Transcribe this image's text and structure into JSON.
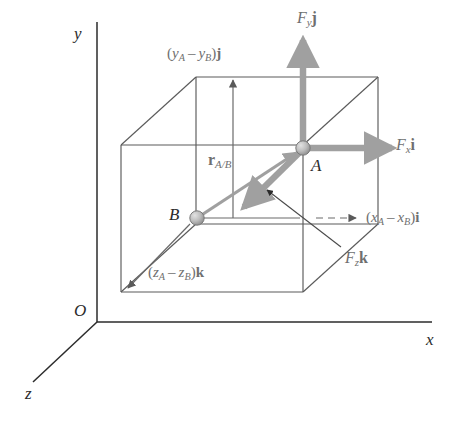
{
  "figure": {
    "background": "#ffffff",
    "width": 462,
    "height": 424
  },
  "colors": {
    "axis_line": "#2b2b2b",
    "box_line": "#5a5a5a",
    "vector_gray": "#a0a0a0",
    "vector_gray_dark": "#8f8f8f",
    "label_gray": "#6f6f6f",
    "label_dark": "#2b2b2b",
    "node_fill": "#b5b5b5",
    "node_stroke": "#7a7a7a"
  },
  "axes": {
    "y_label": "y",
    "x_label": "x",
    "z_label": "z",
    "origin_label": "O"
  },
  "points": [
    {
      "id": "A",
      "label": "A",
      "x": 303,
      "y": 148
    },
    {
      "id": "B",
      "label": "B",
      "x": 197,
      "y": 218
    }
  ],
  "vectors": {
    "position": {
      "name": "r_AB",
      "label_base": "r",
      "label_sub": "A/B",
      "from": "B",
      "to": "A"
    },
    "forces": [
      {
        "name": "Fy",
        "label_base": "F",
        "label_sub": "y",
        "unit": "j",
        "direction": "up"
      },
      {
        "name": "Fx",
        "label_base": "F",
        "label_sub": "x",
        "unit": "i",
        "direction": "right"
      },
      {
        "name": "Fz",
        "label_base": "F",
        "label_sub": "z",
        "unit": "k",
        "direction": "toward-viewer-lower-left"
      }
    ]
  },
  "dimensions": [
    {
      "name": "dy",
      "open_paren": "(",
      "term_a_base": "y",
      "term_a_sub": "A",
      "minus": "–",
      "term_b_base": "y",
      "term_b_sub": "B",
      "close_paren": ")",
      "unit": "j"
    },
    {
      "name": "dz",
      "open_paren": "(",
      "term_a_base": "z",
      "term_a_sub": "A",
      "minus": "–",
      "term_b_base": "z",
      "term_b_sub": "B",
      "close_paren": ")",
      "unit": "k"
    },
    {
      "name": "dx",
      "open_paren": "(",
      "term_a_base": "x",
      "term_a_sub": "A",
      "minus": "–",
      "term_b_base": "x",
      "term_b_sub": "B",
      "close_paren": ")",
      "unit": "i"
    }
  ]
}
